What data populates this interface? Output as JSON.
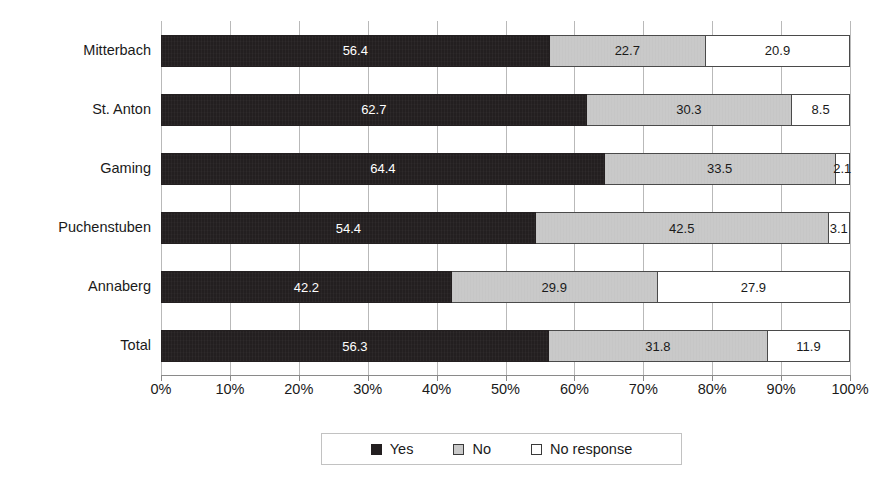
{
  "chart_data": {
    "type": "bar",
    "subtype": "stacked-horizontal-100pct",
    "title": "",
    "xlabel": "",
    "ylabel": "",
    "xlim": [
      0,
      100
    ],
    "grid": true,
    "legend_position": "bottom",
    "categories": [
      "Mitterbach",
      "St. Anton",
      "Gaming",
      "Puchenstuben",
      "Annaberg",
      "Total"
    ],
    "series": [
      {
        "name": "Yes",
        "color": "#231f20",
        "values": [
          56.4,
          62.7,
          64.4,
          54.4,
          42.2,
          56.3
        ]
      },
      {
        "name": "No",
        "color": "#c9c9c9",
        "values": [
          22.7,
          30.3,
          33.5,
          42.5,
          29.9,
          31.8
        ]
      },
      {
        "name": "No response",
        "color": "#ffffff",
        "values": [
          20.9,
          8.5,
          2.1,
          3.1,
          27.9,
          11.9
        ]
      }
    ],
    "tick_labels": [
      "0%",
      "10%",
      "20%",
      "30%",
      "40%",
      "50%",
      "60%",
      "70%",
      "80%",
      "90%",
      "100%"
    ],
    "tick_values": [
      0,
      10,
      20,
      30,
      40,
      50,
      60,
      70,
      80,
      90,
      100
    ]
  },
  "legend": {
    "items": [
      {
        "label": "Yes",
        "swatch": "black-square-swatch"
      },
      {
        "label": "No",
        "swatch": "gray-square-swatch"
      },
      {
        "label": "No response",
        "swatch": "white-square-swatch"
      }
    ]
  }
}
